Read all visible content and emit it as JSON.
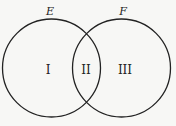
{
  "diagram": {
    "type": "venn",
    "sets": [
      {
        "name": "E",
        "label": "E"
      },
      {
        "name": "F",
        "label": "F"
      }
    ],
    "regions": [
      {
        "id": "only-E",
        "label": "I"
      },
      {
        "id": "E-and-F",
        "label": "II"
      },
      {
        "id": "only-F",
        "label": "III"
      }
    ],
    "colors": {
      "stroke": "#222222",
      "background": "#f7f7f5"
    }
  }
}
